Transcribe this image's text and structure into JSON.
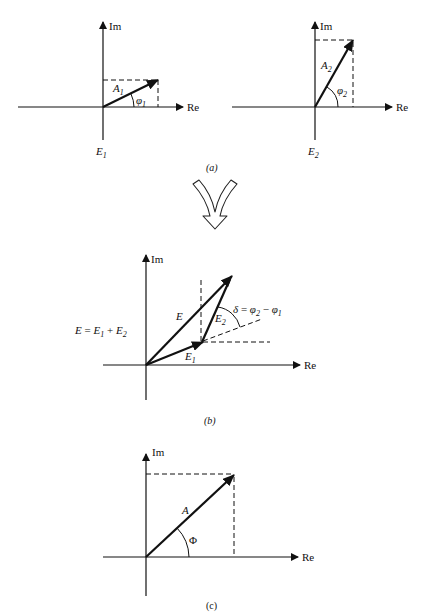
{
  "figure": {
    "panels": [
      {
        "id": "a-left",
        "axis_x_label": "Re",
        "axis_y_label": "Im",
        "vector_label": "A",
        "vector_label_sub": "1",
        "angle_label": "φ",
        "angle_label_sub": "1",
        "field_label": "E",
        "field_label_sub": "1"
      },
      {
        "id": "a-right",
        "axis_x_label": "Re",
        "axis_y_label": "Im",
        "vector_label": "A",
        "vector_label_sub": "2",
        "angle_label": "φ",
        "angle_label_sub": "2",
        "field_label": "E",
        "field_label_sub": "2"
      },
      {
        "id": "b",
        "axis_x_label": "Re",
        "axis_y_label": "Im",
        "sum_vector_label": "E",
        "vector1_label": "E",
        "vector1_sub": "1",
        "vector2_label": "E",
        "vector2_sub": "2",
        "equation": {
          "lhs": "E",
          "eq": " = ",
          "t1": "E",
          "t1_sub": "1",
          "plus": " + ",
          "t2": "E",
          "t2_sub": "2"
        },
        "delta": {
          "symbol": "δ",
          "eq": " = ",
          "a": "φ",
          "a_sub": "2",
          "minus": " − ",
          "b": "φ",
          "b_sub": "1"
        }
      },
      {
        "id": "c",
        "axis_x_label": "Re",
        "axis_y_label": "Im",
        "vector_label": "A",
        "angle_label": "Φ"
      }
    ],
    "captions": {
      "a": "(a)",
      "b": "(b)",
      "c": "(c)"
    }
  }
}
